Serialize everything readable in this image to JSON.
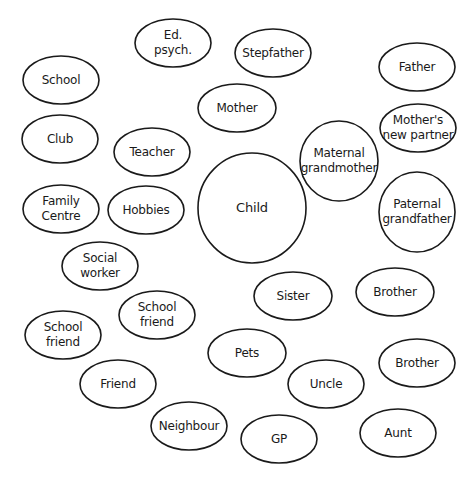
{
  "diagram": {
    "type": "ecomap",
    "center": {
      "id": "child",
      "lines": [
        "Child"
      ]
    },
    "nodes": [
      {
        "id": "ed-psych",
        "lines": [
          "Ed.",
          "psych."
        ]
      },
      {
        "id": "stepfather",
        "lines": [
          "Stepfather"
        ]
      },
      {
        "id": "school",
        "lines": [
          "School"
        ]
      },
      {
        "id": "father",
        "lines": [
          "Father"
        ]
      },
      {
        "id": "mother",
        "lines": [
          "Mother"
        ]
      },
      {
        "id": "club",
        "lines": [
          "Club"
        ]
      },
      {
        "id": "teacher",
        "lines": [
          "Teacher"
        ]
      },
      {
        "id": "mothers-new-partner",
        "lines": [
          "Mother's",
          "new partner"
        ]
      },
      {
        "id": "maternal-grandmother",
        "lines": [
          "Maternal",
          "grandmother"
        ]
      },
      {
        "id": "family-centre",
        "lines": [
          "Family",
          "Centre"
        ]
      },
      {
        "id": "hobbies",
        "lines": [
          "Hobbies"
        ]
      },
      {
        "id": "paternal-grandfather",
        "lines": [
          "Paternal",
          "grandfather"
        ]
      },
      {
        "id": "social-worker",
        "lines": [
          "Social",
          "worker"
        ]
      },
      {
        "id": "sister",
        "lines": [
          "Sister"
        ]
      },
      {
        "id": "brother-1",
        "lines": [
          "Brother"
        ]
      },
      {
        "id": "school-friend-1",
        "lines": [
          "School",
          "friend"
        ]
      },
      {
        "id": "school-friend-2",
        "lines": [
          "School",
          "friend"
        ]
      },
      {
        "id": "pets",
        "lines": [
          "Pets"
        ]
      },
      {
        "id": "brother-2",
        "lines": [
          "Brother"
        ]
      },
      {
        "id": "friend",
        "lines": [
          "Friend"
        ]
      },
      {
        "id": "uncle",
        "lines": [
          "Uncle"
        ]
      },
      {
        "id": "neighbour",
        "lines": [
          "Neighbour"
        ]
      },
      {
        "id": "gp",
        "lines": [
          "GP"
        ]
      },
      {
        "id": "aunt",
        "lines": [
          "Aunt"
        ]
      }
    ],
    "colors": {
      "stroke": "#1a1a1a",
      "fill": "#ffffff",
      "text": "#1a1a1a"
    }
  }
}
